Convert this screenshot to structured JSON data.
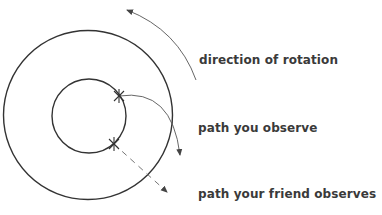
{
  "labels": {
    "rotation": "direction of rotation",
    "you": "path you observe",
    "friend": "path your friend observes"
  },
  "colors": {
    "circle": "#333333",
    "path": "#555555",
    "text": "#3a3a3a"
  }
}
